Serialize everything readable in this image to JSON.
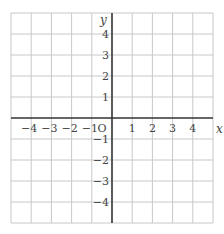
{
  "chart_data": {
    "type": "scatter",
    "title": "",
    "xlabel": "x",
    "ylabel": "y",
    "origin_label": "O",
    "xlim": [
      -5,
      5
    ],
    "ylim": [
      -5,
      5
    ],
    "grid": true,
    "x_ticks": [
      -4,
      -3,
      -2,
      -1,
      1,
      2,
      3,
      4
    ],
    "y_ticks": [
      4,
      3,
      2,
      1,
      -1,
      -2,
      -3,
      -4
    ],
    "x_tick_labels": [
      "−4",
      "−3",
      "−2",
      "−1",
      "1",
      "2",
      "3",
      "4"
    ],
    "y_tick_labels": [
      "4",
      "3",
      "2",
      "1",
      "−1",
      "−2",
      "−3",
      "−4"
    ],
    "series": [],
    "colors": {
      "grid": "#c8c8c8",
      "axis": "#333333",
      "text": "#444444"
    }
  }
}
